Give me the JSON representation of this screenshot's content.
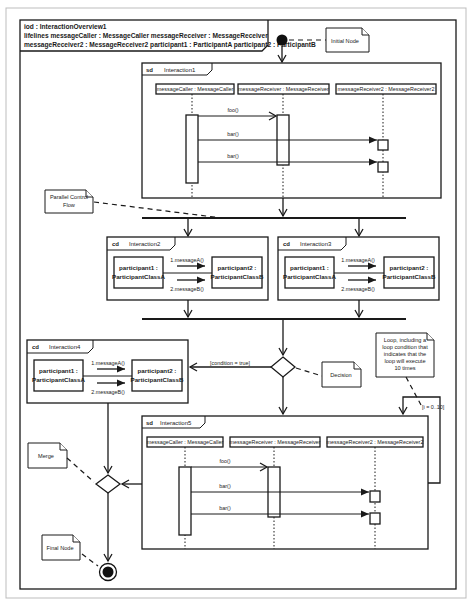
{
  "header": {
    "line1": "iod : InteractionOverview1",
    "line2": "lifelines messageCaller : MessageCaller messageReceiver : MessageReceiver",
    "line3": "messageReceiver2 : MessageReceiver2 participant1 : ParticipantA participant2 : ParticipantB"
  },
  "notes": {
    "initial_node": "Initial Node",
    "parallel_1": "Parallel Control",
    "parallel_2": "Flow",
    "decision": "Decision",
    "loop_1": "Loop, including a",
    "loop_2": "loop condition that",
    "loop_3": "indicates that the",
    "loop_4": "loop will execute",
    "loop_5": "10 times",
    "merge": "Merge",
    "final_node": "Final Node"
  },
  "guards": {
    "decision": "[condition = true]",
    "loop": "[i = 0..10]"
  },
  "interaction1": {
    "kind": "sd",
    "name": "Interaction1",
    "lifelines": [
      "messageCaller : MessageCaller",
      "messageReceiver : MessageReceiver",
      "messageReceiver2 : MessageReceiver2"
    ],
    "messages": [
      "foo()",
      "bar()",
      "bar()"
    ]
  },
  "interaction2": {
    "kind": "cd",
    "name": "Interaction2",
    "p1a": "participant1 :",
    "p1b": "ParticipantClassA",
    "p2a": "participant2 :",
    "p2b": "ParticipantClassB",
    "m1": "1.messageA()",
    "m2": "2.messageB()"
  },
  "interaction3": {
    "kind": "cd",
    "name": "Interaction3",
    "p1a": "participant1 :",
    "p1b": "ParticipantClassA",
    "p2a": "participant2 :",
    "p2b": "ParticipantClassB",
    "m1": "1.messageA()",
    "m2": "2.messageB()"
  },
  "interaction4": {
    "kind": "cd",
    "name": "Interaction4",
    "p1a": "participant1 :",
    "p1b": "ParticipantClassA",
    "p2a": "participant2 :",
    "p2b": "ParticipantClassB",
    "m1": "1.messageA()",
    "m2": "2.messageB()"
  },
  "interaction5": {
    "kind": "sd",
    "name": "Interaction5",
    "lifelines": [
      "messageCaller : MessageCaller",
      "messageReceiver : MessageReceiver",
      "messageReceiver2 : MessageReceiver2"
    ],
    "messages": [
      "foo()",
      "bar()",
      "bar()"
    ]
  }
}
